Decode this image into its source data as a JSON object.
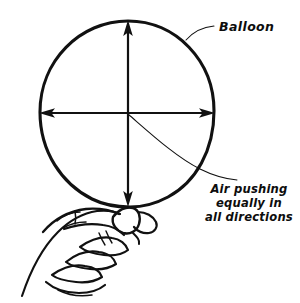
{
  "figure": {
    "background_color": "#ffffff",
    "ink_color": "#111111"
  },
  "labels": {
    "balloon": "Balloon",
    "caption_line_1": "Air pushing",
    "caption_line_2": "equally in",
    "caption_line_3": "all directions"
  },
  "annotations": {
    "arrow_up_name": "upward pressure arrow",
    "arrow_down_name": "downward pressure arrow",
    "arrow_left_name": "leftward pressure arrow",
    "arrow_right_name": "rightward pressure arrow"
  }
}
